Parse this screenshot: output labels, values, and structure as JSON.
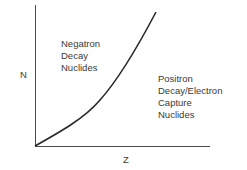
{
  "diagram": {
    "y_axis_label": "N",
    "x_axis_label": "Z",
    "region_above": {
      "lines": [
        "Negatron",
        "Decay",
        "Nuclides"
      ]
    },
    "region_below": {
      "lines": [
        "Positron",
        "Decay/Electron",
        "Capture",
        "Nuclides"
      ]
    },
    "colors": {
      "line": "#2a2a2a",
      "text": "#3a3a3a",
      "background": "#ffffff"
    }
  }
}
